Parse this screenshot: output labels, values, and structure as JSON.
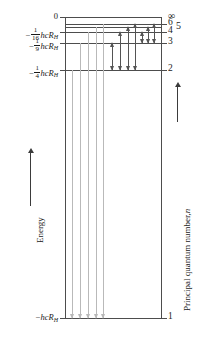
{
  "figure": {
    "type": "energy-level-diagram",
    "colors": {
      "line": "#4d4d4d",
      "lyman_arrow": "#b9b9b9",
      "balmer_arrow": "#545454",
      "paschen_arrow": "#545454",
      "text": "#1a1a1a"
    }
  },
  "left_axis": {
    "caption": "Energy",
    "arrow_direction": "up",
    "labels": [
      {
        "id": "e-zero",
        "text": "0",
        "numerator": "",
        "denominator": "",
        "unit": "",
        "y": 17
      },
      {
        "id": "e-n4",
        "text": "",
        "numerator": "1",
        "denominator": "16",
        "unit": "hcR",
        "sub": "H",
        "sign": "−",
        "y": 32
      },
      {
        "id": "e-n3",
        "text": "",
        "numerator": "1",
        "denominator": "9",
        "unit": "hcR",
        "sub": "H",
        "sign": "−",
        "y": 43
      },
      {
        "id": "e-n2",
        "text": "",
        "numerator": "1",
        "denominator": "4",
        "unit": "hcR",
        "sub": "H",
        "sign": "−",
        "y": 70
      },
      {
        "id": "e-n1",
        "text": "",
        "numerator": "",
        "denominator": "",
        "unit": "hcR",
        "sub": "H",
        "sign": "−",
        "y": 318
      }
    ]
  },
  "right_axis": {
    "caption": "Principal quantum number,",
    "caption_italic": "n",
    "arrow_direction": "up",
    "labels": [
      {
        "id": "n-inf",
        "text": "∞",
        "y": 17
      },
      {
        "id": "n-6",
        "text": "6",
        "y": 24
      },
      {
        "id": "n-5",
        "text": "5",
        "y": 27
      },
      {
        "id": "n-4",
        "text": "4",
        "y": 32
      },
      {
        "id": "n-3",
        "text": "3",
        "y": 43
      },
      {
        "id": "n-2",
        "text": "2",
        "y": 70
      },
      {
        "id": "n-1",
        "text": "1",
        "y": 318
      }
    ]
  },
  "chart_data": {
    "type": "energy-level",
    "xlabel": "",
    "ylabel": "Energy",
    "y2label": "Principal quantum number, n",
    "levels": [
      {
        "n": "∞",
        "energy_label": "0",
        "y": 17,
        "span": "full"
      },
      {
        "n": "6",
        "energy_label": "",
        "y": 24,
        "span": "full"
      },
      {
        "n": "5",
        "energy_label": "",
        "y": 27,
        "span": "full"
      },
      {
        "n": "4",
        "energy_label": "-1/16 hcR_H",
        "y": 32,
        "span": "full"
      },
      {
        "n": "3",
        "energy_label": "-1/9 hcR_H",
        "y": 43,
        "span": "full"
      },
      {
        "n": "2",
        "energy_label": "-1/4 hcR_H",
        "y": 70,
        "span": "full"
      },
      {
        "n": "1",
        "energy_label": "-hcR_H",
        "y": 318,
        "span": "full"
      }
    ],
    "series": [
      {
        "name": "Lyman",
        "final_n": 1,
        "color": "#b9b9b9",
        "transitions": [
          {
            "from_n": 2,
            "to_n": 1,
            "x": 72,
            "y_top": 70,
            "y_bottom": 318
          },
          {
            "from_n": 3,
            "to_n": 1,
            "x": 80,
            "y_top": 43,
            "y_bottom": 318
          },
          {
            "from_n": 4,
            "to_n": 1,
            "x": 88,
            "y_top": 32,
            "y_bottom": 318
          },
          {
            "from_n": 5,
            "to_n": 1,
            "x": 96,
            "y_top": 27,
            "y_bottom": 318
          },
          {
            "from_n": 6,
            "to_n": 1,
            "x": 103,
            "y_top": 24,
            "y_bottom": 318
          }
        ]
      },
      {
        "name": "Balmer",
        "final_n": 2,
        "color": "#545454",
        "transitions": [
          {
            "from_n": 3,
            "to_n": 2,
            "x": 112,
            "y_top": 43,
            "y_bottom": 70
          },
          {
            "from_n": 4,
            "to_n": 2,
            "x": 120,
            "y_top": 32,
            "y_bottom": 70
          },
          {
            "from_n": 5,
            "to_n": 2,
            "x": 128,
            "y_top": 27,
            "y_bottom": 70
          },
          {
            "from_n": 6,
            "to_n": 2,
            "x": 135,
            "y_top": 24,
            "y_bottom": 70
          }
        ]
      },
      {
        "name": "Paschen",
        "final_n": 3,
        "color": "#545454",
        "transitions": [
          {
            "from_n": 4,
            "to_n": 3,
            "x": 142,
            "y_top": 32,
            "y_bottom": 43
          },
          {
            "from_n": 5,
            "to_n": 3,
            "x": 148,
            "y_top": 27,
            "y_bottom": 43
          },
          {
            "from_n": 6,
            "to_n": 3,
            "x": 154,
            "y_top": 24,
            "y_bottom": 43
          }
        ]
      }
    ]
  }
}
